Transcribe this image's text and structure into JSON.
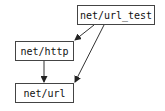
{
  "diagram": {
    "type": "dependency-graph",
    "nodes": [
      {
        "id": "url_test",
        "label": "net/url_test"
      },
      {
        "id": "http",
        "label": "net/http"
      },
      {
        "id": "url",
        "label": "net/url"
      }
    ],
    "edges": [
      {
        "from": "net/url_test",
        "to": "net/http"
      },
      {
        "from": "net/url_test",
        "to": "net/url"
      },
      {
        "from": "net/http",
        "to": "net/url"
      }
    ],
    "colors": {
      "line": "#333333",
      "border": "#444444",
      "background": "#ffffff"
    }
  }
}
